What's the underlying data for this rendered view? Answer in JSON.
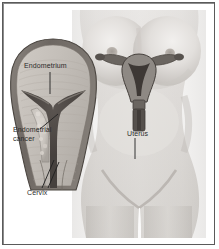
{
  "figure": {
    "background_color": "#ffffff",
    "frame_color": "#5a5a5a",
    "illustration_style": "grayscale medical illustration"
  },
  "labels": {
    "endometrium": "Endometrium",
    "endometrial_cancer_line1": "Endometrial",
    "endometrial_cancer_line2": "cancer",
    "cervix": "Cervix",
    "uterus": "Uterus"
  },
  "panels": {
    "torso": {
      "name": "female-torso-photo",
      "description": "Front view of a female torso from chest to upper thighs",
      "skin_tone": "#d8d6d3"
    },
    "cutaway": {
      "name": "uterus-cross-section",
      "description": "Magnified cross-section of the uterus showing endometrium, endometrial cancer and cervix",
      "wall_color": "#6b6560",
      "tissue_color": "#bdb8b2",
      "cavity_color": "#4a4542"
    },
    "inset_organ": {
      "name": "uterus-diagram",
      "description": "Small uterus, fallopian tubes, ovaries and vaginal canal overlaid on the pelvis",
      "organ_color": "#5f5a56"
    }
  },
  "colors": {
    "text": "#2b2b2b",
    "leader_line": "#1f1f1f",
    "frame": "#5a5a5a"
  }
}
